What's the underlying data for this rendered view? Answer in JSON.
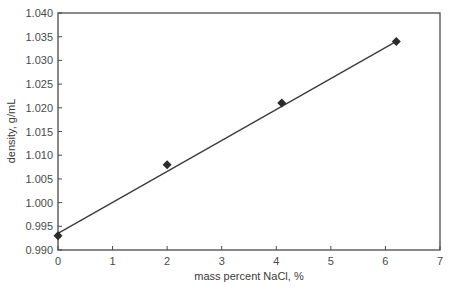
{
  "chart_data": {
    "type": "scatter",
    "title": "",
    "xlabel": "mass percent NaCl, %",
    "ylabel": "density, g/mL",
    "xlim": [
      0,
      7
    ],
    "ylim": [
      0.99,
      1.04
    ],
    "x_ticks": [
      "0",
      "1",
      "2",
      "3",
      "4",
      "5",
      "6",
      "7"
    ],
    "y_ticks": [
      "0.990",
      "0.995",
      "1.000",
      "1.005",
      "1.010",
      "1.015",
      "1.020",
      "1.025",
      "1.030",
      "1.035",
      "1.040"
    ],
    "grid": false,
    "legend": null,
    "series": [
      {
        "name": "measured density",
        "marker": "diamond",
        "x": [
          0,
          2.0,
          4.1,
          6.2
        ],
        "y": [
          0.993,
          1.008,
          1.021,
          1.034
        ]
      },
      {
        "name": "linear fit",
        "style": "line",
        "x": [
          0,
          6.2
        ],
        "y": [
          0.9935,
          1.034
        ]
      }
    ],
    "colors": {
      "axis": "#4a4a4a",
      "line": "#3a3a3a",
      "marker": "#2b2b2b",
      "background": "#ffffff"
    }
  }
}
